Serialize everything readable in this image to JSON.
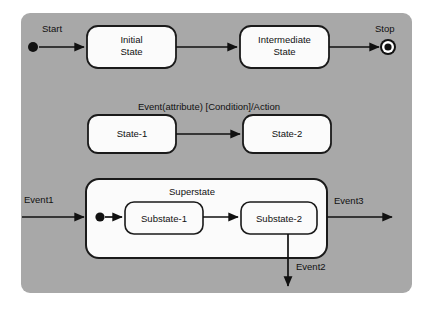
{
  "diagram": {
    "type": "uml-state-diagram",
    "panel": {
      "background_color": "#a8a8a8",
      "x": 21,
      "y": 13,
      "width": 391,
      "height": 280,
      "radius": 9
    },
    "canvas": {
      "width": 429,
      "height": 309,
      "background_color": "#ffffff"
    },
    "row1": {
      "start_label": "Start",
      "stop_label": "Stop",
      "states": [
        {
          "id": "initial-state",
          "line1": "Initial",
          "line2": "State"
        },
        {
          "id": "intermediate-state",
          "line1": "Intermediate",
          "line2": "State"
        }
      ]
    },
    "row2": {
      "transition_label": "Event(attribute) [Condition]/Action",
      "states": [
        {
          "id": "state-1",
          "label": "State-1"
        },
        {
          "id": "state-2",
          "label": "State-2"
        }
      ]
    },
    "row3": {
      "superstate_title": "Superstate",
      "substates": [
        {
          "id": "substate-1",
          "label": "Substate-1"
        },
        {
          "id": "substate-2",
          "label": "Substate-2"
        }
      ],
      "events": {
        "in": "Event1",
        "out_right": "Event3",
        "out_bottom": "Event2"
      }
    },
    "colors": {
      "panel_gray": "#a8a8a8",
      "box_fill": "#fbfbfb",
      "stroke": "#111111",
      "page_white": "#ffffff"
    }
  }
}
